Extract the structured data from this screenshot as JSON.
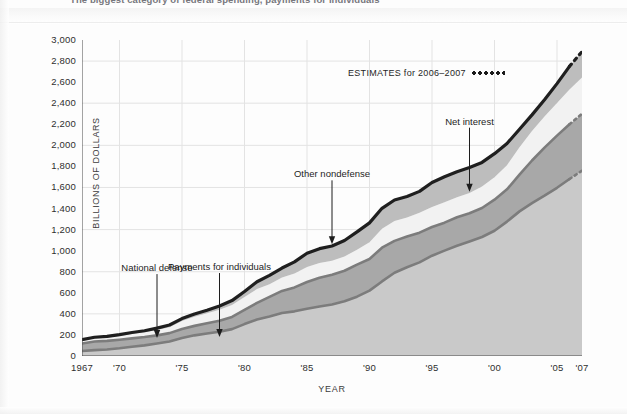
{
  "headline": {
    "text": "The biggest category of federal spending, payments for individuals"
  },
  "legend": {
    "estimates_label": "ESTIMATES for 2006–2007",
    "estimates_marker": "dotted-line-sample"
  },
  "axes": {
    "y_title": "BILLIONS OF DOLLARS",
    "x_title": "YEAR",
    "y_ticks": [
      "0",
      "200",
      "400",
      "600",
      "800",
      "1,000",
      "1,200",
      "1,400",
      "1,600",
      "1,800",
      "2,000",
      "2,200",
      "2,400",
      "2,600",
      "2,800",
      "3,000"
    ],
    "x_ticks": [
      "1967",
      "'70",
      "'75",
      "'80",
      "'85",
      "'90",
      "'95",
      "'00",
      "'05",
      "'07"
    ]
  },
  "annotations": [
    {
      "label": "National defense",
      "x_year": 1973,
      "y_value": 170
    },
    {
      "label": "Payments for individuals",
      "x_year": 1978,
      "y_value": 180
    },
    {
      "label": "Other nondefense",
      "x_year": 1987,
      "y_value": 1060
    },
    {
      "label": "Net interest",
      "x_year": 1998,
      "y_value": 1560
    }
  ],
  "colors": {
    "payments_band": "#c9c9c9",
    "defense_band": "#a8a8a8",
    "other_nondefense_band": "#f2f2f2",
    "net_interest_band": "#bdbdbd",
    "top_outline": "#1f1f1f",
    "defense_outline": "#7c7c7c",
    "payments_outline": "#7c7c7c",
    "gridline": "#e3e3e3",
    "axis": "#4a4a4a"
  },
  "chart_data": {
    "type": "area",
    "subtitle": "ESTIMATES for 2006–2007",
    "xlabel": "YEAR",
    "ylabel": "BILLIONS OF DOLLARS",
    "xlim": [
      1967,
      2007
    ],
    "ylim": [
      0,
      3000
    ],
    "ytick_step": 200,
    "grid": true,
    "legend_position": "inline-annotations",
    "estimate_years": [
      2006,
      2007
    ],
    "stacked": true,
    "x": [
      1967,
      1968,
      1969,
      1970,
      1971,
      1972,
      1973,
      1974,
      1975,
      1976,
      1977,
      1978,
      1979,
      1980,
      1981,
      1982,
      1983,
      1984,
      1985,
      1986,
      1987,
      1988,
      1989,
      1990,
      1991,
      1992,
      1993,
      1994,
      1995,
      1996,
      1997,
      1998,
      1999,
      2000,
      2001,
      2002,
      2003,
      2004,
      2005,
      2006,
      2007
    ],
    "series": [
      {
        "name": "Payments for individuals",
        "values": [
          48,
          56,
          62,
          73,
          88,
          101,
          119,
          137,
          170,
          196,
          214,
          230,
          255,
          303,
          347,
          375,
          408,
          424,
          449,
          470,
          489,
          519,
          563,
          621,
          708,
          790,
          842,
          889,
          952,
          1000,
          1046,
          1087,
          1130,
          1189,
          1276,
          1373,
          1451,
          1522,
          1597,
          1680,
          1760
        ]
      },
      {
        "name": "National defense",
        "values": [
          71,
          82,
          82,
          82,
          79,
          79,
          77,
          80,
          87,
          90,
          97,
          104,
          116,
          134,
          158,
          186,
          210,
          227,
          253,
          273,
          282,
          290,
          304,
          300,
          320,
          303,
          292,
          282,
          273,
          266,
          271,
          268,
          275,
          295,
          306,
          349,
          405,
          456,
          495,
          520,
          540
        ]
      },
      {
        "name": "Other nondefense",
        "values": [
          26,
          29,
          30,
          34,
          41,
          45,
          52,
          56,
          75,
          86,
          94,
          106,
          112,
          122,
          131,
          120,
          127,
          132,
          144,
          140,
          134,
          136,
          142,
          159,
          180,
          189,
          182,
          189,
          190,
          194,
          189,
          193,
          203,
          214,
          230,
          260,
          280,
          295,
          310,
          330,
          345
        ]
      },
      {
        "name": "Net interest",
        "values": [
          10,
          11,
          12,
          14,
          15,
          15,
          17,
          21,
          23,
          27,
          30,
          35,
          43,
          53,
          69,
          85,
          90,
          111,
          130,
          136,
          139,
          152,
          169,
          184,
          194,
          199,
          199,
          203,
          232,
          241,
          244,
          241,
          230,
          223,
          206,
          171,
          153,
          160,
          184,
          220,
          245
        ]
      }
    ],
    "totals": [
      155,
      178,
      186,
      203,
      223,
      240,
      265,
      294,
      355,
      399,
      435,
      475,
      526,
      612,
      705,
      766,
      835,
      894,
      976,
      1019,
      1044,
      1097,
      1178,
      1264,
      1402,
      1481,
      1515,
      1563,
      1647,
      1701,
      1750,
      1789,
      1838,
      1921,
      2018,
      2153,
      2289,
      2433,
      2586,
      2750,
      2890
    ]
  }
}
